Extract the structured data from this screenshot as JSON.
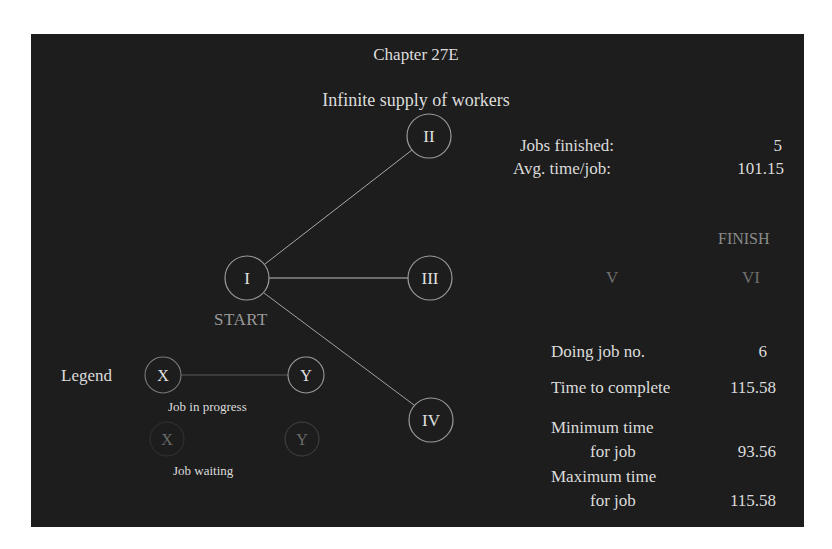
{
  "header": {
    "title": "Chapter 27E",
    "subtitle": "Infinite supply of workers"
  },
  "nodes": {
    "I": "I",
    "II": "II",
    "III": "III",
    "IV": "IV",
    "V": "V",
    "VI": "VI",
    "start_label": "START",
    "finish_label": "FINISH"
  },
  "stats": {
    "jobs_finished_label": "Jobs finished:",
    "jobs_finished_value": "5",
    "avg_time_label": "Avg. time/job:",
    "avg_time_value": "101.15",
    "doing_job_label": "Doing job no.",
    "doing_job_value": "6",
    "time_to_complete_label": "Time to complete",
    "time_to_complete_value": "115.58",
    "min_time_label_1": "Minimum time",
    "min_time_label_2": "for job",
    "min_time_value": "93.56",
    "max_time_label_1": "Maximum time",
    "max_time_label_2": "for job",
    "max_time_value": "115.58"
  },
  "legend": {
    "title": "Legend",
    "node_x": "X",
    "node_y": "Y",
    "in_progress_label": "Job in progress",
    "waiting_label": "Job waiting"
  },
  "colors": {
    "background": "#1d1d1d",
    "text": "#dcdcdc",
    "active_edge": "#bdbdbd",
    "dim": "#6e6e6e"
  }
}
